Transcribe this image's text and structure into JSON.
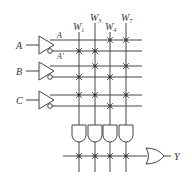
{
  "diagram": {
    "type": "PLA / ROM logic array",
    "inputs": [
      {
        "name": "A",
        "true_label": "A",
        "comp_label": "A'"
      },
      {
        "name": "B"
      },
      {
        "name": "C"
      }
    ],
    "word_lines": [
      {
        "label": "W",
        "sub": "1"
      },
      {
        "label": "W",
        "sub": "3"
      },
      {
        "label": "W",
        "sub": "4"
      },
      {
        "label": "W",
        "sub": "7"
      }
    ],
    "connections": {
      "A": [
        "W4",
        "W7"
      ],
      "A'": [
        "W1",
        "W3"
      ],
      "B": [
        "W3",
        "W7"
      ],
      "B'": [
        "W1",
        "W4"
      ],
      "C": [
        "W1",
        "W3",
        "W7"
      ],
      "C'": [
        "W4"
      ]
    },
    "and_gates": 4,
    "or_gate_inputs": [
      "W1",
      "W3",
      "W4",
      "W7"
    ],
    "output": "Y",
    "colors": {
      "line": "#444444",
      "text": "#333333",
      "background": "#ffffff"
    }
  }
}
